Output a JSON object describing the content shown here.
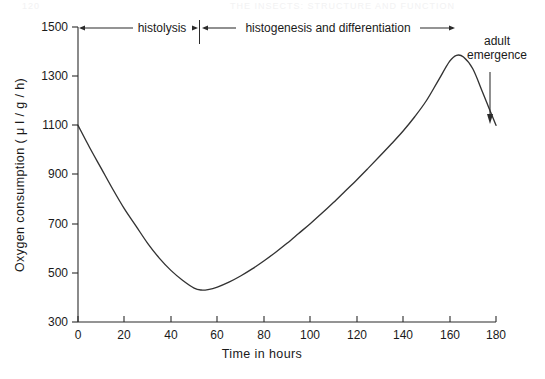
{
  "page": {
    "running_head_left": "120",
    "running_head_right": "THE INSECTS: STRUCTURE AND FUNCTION"
  },
  "chart_data": {
    "type": "line",
    "title": "",
    "xlabel": "Time in  hours",
    "ylabel": "Oxygen consumption ( μ l / g / h)",
    "xlim": [
      0,
      180
    ],
    "ylim": [
      300,
      1500
    ],
    "xticks": [
      0,
      20,
      40,
      60,
      80,
      100,
      120,
      140,
      160,
      180
    ],
    "yticks": [
      300,
      500,
      700,
      900,
      1100,
      1300,
      1500
    ],
    "xtick_labels": [
      "0",
      "20",
      "40",
      "60",
      "80",
      "100",
      "120",
      "140",
      "160",
      "180"
    ],
    "ytick_labels": [
      "300",
      "500",
      "700",
      "900",
      "1100",
      "1300",
      "1500"
    ],
    "grid": false,
    "legend": null,
    "series": [
      {
        "name": "Oxygen consumption",
        "color": "#333333",
        "x": [
          0,
          5,
          10,
          15,
          20,
          25,
          30,
          35,
          40,
          45,
          50,
          53,
          56,
          60,
          65,
          70,
          75,
          80,
          85,
          90,
          95,
          100,
          105,
          110,
          115,
          120,
          125,
          130,
          135,
          140,
          145,
          150,
          155,
          160,
          163,
          166,
          170,
          174,
          177,
          180
        ],
        "y": [
          1100,
          1010,
          925,
          840,
          760,
          690,
          620,
          560,
          510,
          470,
          438,
          430,
          432,
          442,
          462,
          487,
          516,
          548,
          583,
          620,
          660,
          700,
          742,
          786,
          832,
          878,
          926,
          975,
          1025,
          1077,
          1135,
          1200,
          1280,
          1360,
          1385,
          1378,
          1330,
          1240,
          1170,
          1100
        ]
      }
    ],
    "annotations": [
      {
        "id": "histolysis",
        "label": "histolysis",
        "x_start": 0,
        "x_end": 52,
        "y": 1500,
        "style": "double-arrow-bracket"
      },
      {
        "id": "histogenesis",
        "label": "histogenesis and differentiation",
        "x_start": 52,
        "x_end": 180,
        "y": 1500,
        "style": "double-arrow-bracket"
      },
      {
        "id": "adult-emergence",
        "label_line_1": "adult",
        "label_line_2": "emergence",
        "x": 180,
        "y_from": 1390,
        "y_to": 1170,
        "style": "down-arrow"
      }
    ]
  }
}
